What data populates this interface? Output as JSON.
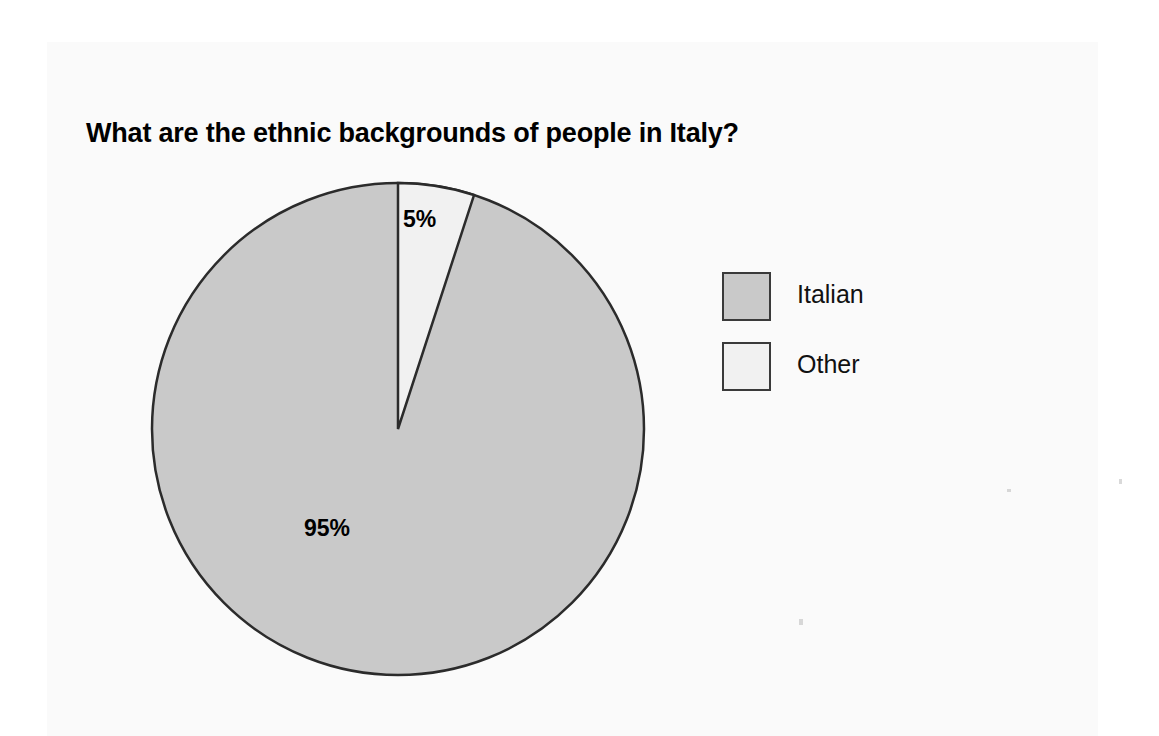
{
  "page": {
    "background_color": "#ffffff",
    "panel_color": "#fafafa"
  },
  "chart_data": {
    "type": "pie",
    "title": "What are the ethnic backgrounds of people in Italy?",
    "categories": [
      "Italian",
      "Other"
    ],
    "values": [
      95,
      5
    ],
    "value_unit": "%",
    "data_labels": [
      "95%",
      "5%"
    ],
    "colors": [
      "#c9c9c9",
      "#f1f1f1"
    ],
    "outline_color": "#2b2b2b",
    "start_angle_deg": 0,
    "direction": "clockwise",
    "legend_position": "right",
    "legend": [
      {
        "label": "Italian",
        "color": "#c9c9c9"
      },
      {
        "label": "Other",
        "color": "#f1f1f1"
      }
    ],
    "xlabel": "",
    "ylabel": "",
    "grid": false
  },
  "labels": {
    "slice_other": "5%",
    "slice_italian": "95%"
  },
  "legend": {
    "items": [
      {
        "label": "Italian",
        "swatch": "gray-swatch-icon"
      },
      {
        "label": "Other",
        "swatch": "white-swatch-icon"
      }
    ]
  }
}
